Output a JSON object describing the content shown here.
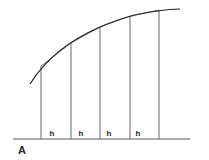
{
  "figure": {
    "panel_label": "A",
    "interval_label": "h",
    "interval_count": 4,
    "colors": {
      "curve": "#222222",
      "chord": "#777777",
      "ordinate": "#666666",
      "baseline": "#555555",
      "text": "#222222"
    },
    "baseline": {
      "x1": 13,
      "x2": 190,
      "y": 139
    },
    "ordinates": [
      {
        "x": 41,
        "top": 66
      },
      {
        "x": 71,
        "top": 43
      },
      {
        "x": 100,
        "top": 27
      },
      {
        "x": 130,
        "top": 16
      },
      {
        "x": 159,
        "top": 10
      }
    ],
    "curve_path": "M30,84 C45,60 70,40 100,27 C125,16 150,10 180,9",
    "h_labels": [
      {
        "x": 52,
        "y": 136,
        "text": "h"
      },
      {
        "x": 81,
        "y": 136,
        "text": "h"
      },
      {
        "x": 109,
        "y": 136,
        "text": "h"
      },
      {
        "x": 138,
        "y": 136,
        "text": "h"
      }
    ],
    "panel_label_pos": {
      "x": 18,
      "y": 154
    }
  }
}
